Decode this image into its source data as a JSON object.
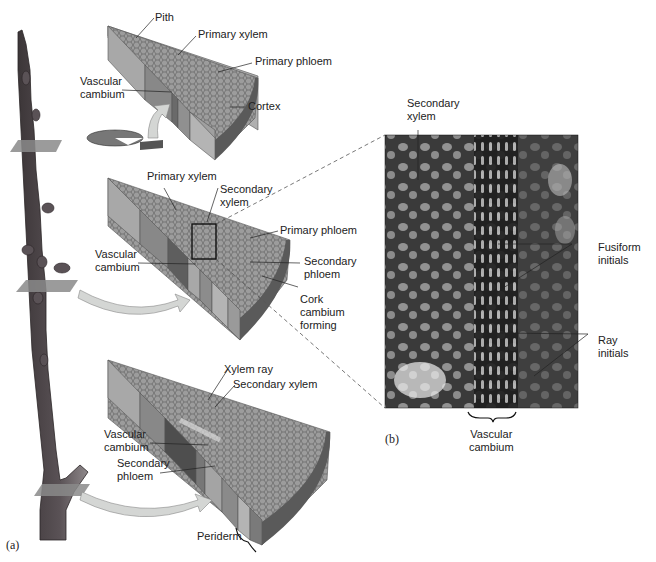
{
  "figure": {
    "panels": [
      {
        "id": "a",
        "label": "(a)"
      },
      {
        "id": "b",
        "label": "(b)"
      }
    ],
    "wedge_top": {
      "labels": {
        "pith": "Pith",
        "primary_xylem": "Primary xylem",
        "primary_phloem": "Primary phloem",
        "vascular_cambium": "Vascular\ncambium",
        "cortex": "Cortex"
      }
    },
    "wedge_middle": {
      "labels": {
        "primary_xylem": "Primary xylem",
        "secondary_xylem": "Secondary\nxylem",
        "primary_phloem": "Primary phloem",
        "vascular_cambium": "Vascular\ncambium",
        "secondary_phloem": "Secondary\nphloem",
        "cork_cambium": "Cork\ncambium\nforming"
      }
    },
    "wedge_bottom": {
      "labels": {
        "xylem_ray": "Xylem ray",
        "secondary_xylem": "Secondary xylem",
        "vascular_cambium": "Vascular\ncambium",
        "secondary_phloem": "Secondary\nphloem",
        "periderm": "Periderm"
      }
    },
    "micrograph": {
      "labels": {
        "secondary_xylem": "Secondary\nxylem",
        "fusiform_initials": "Fusiform\ninitials",
        "ray_initials": "Ray\ninitials",
        "vascular_cambium": "Vascular\ncambium"
      }
    },
    "colors": {
      "stem_dark": "#4a4448",
      "stem_light": "#8c8688",
      "wedge_face": "#9a9a9a",
      "wedge_side": "#b4b4b4",
      "wedge_end": "#6e6e6e",
      "arrow_fill": "#d4d6d4",
      "micrograph_bg": "#2a2a2a"
    }
  }
}
